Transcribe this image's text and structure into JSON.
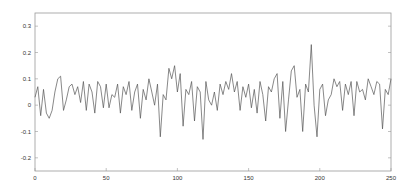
{
  "chart_data": {
    "type": "line",
    "title": "",
    "xlabel": "",
    "ylabel": "",
    "xlim": [
      0,
      250
    ],
    "ylim": [
      -0.25,
      0.35
    ],
    "grid": false,
    "legend": null,
    "xticks": [
      0,
      50,
      100,
      150,
      200,
      250
    ],
    "xtick_labels": [
      "0",
      "50",
      "100",
      "150",
      "200",
      "250"
    ],
    "yticks": [
      -0.2,
      -0.1,
      0,
      0.1,
      0.2,
      0.3
    ],
    "ytick_labels": [
      "-0.2",
      "-0.1",
      "0",
      "0.1",
      "0.2",
      "0.3"
    ],
    "line_color": "#555555",
    "series": [
      {
        "name": "signal",
        "x": [
          0,
          2,
          4,
          6,
          8,
          10,
          12,
          14,
          16,
          18,
          20,
          22,
          24,
          26,
          28,
          30,
          32,
          34,
          36,
          38,
          40,
          42,
          44,
          46,
          48,
          50,
          52,
          54,
          56,
          58,
          60,
          62,
          64,
          66,
          68,
          70,
          72,
          74,
          76,
          78,
          80,
          82,
          84,
          86,
          88,
          90,
          92,
          94,
          96,
          98,
          100,
          102,
          104,
          106,
          108,
          110,
          112,
          114,
          116,
          118,
          120,
          122,
          124,
          126,
          128,
          130,
          132,
          134,
          136,
          138,
          140,
          142,
          144,
          146,
          148,
          150,
          152,
          154,
          156,
          158,
          160,
          162,
          164,
          166,
          168,
          170,
          172,
          174,
          176,
          178,
          180,
          182,
          184,
          186,
          188,
          190,
          192,
          194,
          196,
          198,
          200,
          202,
          204,
          206,
          208,
          210,
          212,
          214,
          216,
          218,
          220,
          222,
          224,
          226,
          228,
          230,
          232,
          234,
          236,
          238,
          240,
          242,
          244,
          246,
          248,
          250
        ],
        "values": [
          0.03,
          0.07,
          -0.04,
          0.06,
          -0.03,
          -0.05,
          -0.02,
          0.05,
          0.1,
          0.11,
          -0.02,
          0.02,
          0.07,
          0.08,
          0.04,
          0.07,
          0.01,
          0.09,
          -0.02,
          0.08,
          0.05,
          -0.03,
          0.09,
          0.07,
          -0.01,
          0.08,
          -0.01,
          0.04,
          0.03,
          0.08,
          -0.03,
          0.07,
          0.04,
          0.09,
          -0.02,
          0.05,
          0.08,
          -0.05,
          0.06,
          0.02,
          0.1,
          0.05,
          0.0,
          0.08,
          -0.12,
          0.04,
          0.02,
          0.14,
          0.1,
          0.15,
          0.05,
          0.12,
          -0.08,
          0.06,
          0.04,
          0.09,
          -0.06,
          0.07,
          0.05,
          -0.13,
          0.09,
          0.02,
          0.0,
          0.05,
          -0.02,
          0.08,
          0.04,
          0.09,
          0.06,
          0.12,
          0.05,
          0.09,
          -0.02,
          0.07,
          0.03,
          0.08,
          -0.01,
          0.06,
          -0.03,
          0.09,
          0.04,
          -0.06,
          0.07,
          0.05,
          0.1,
          0.12,
          -0.05,
          0.09,
          -0.1,
          0.02,
          0.13,
          0.15,
          0.03,
          0.06,
          -0.1,
          0.08,
          0.05,
          0.23,
          0.0,
          -0.12,
          0.06,
          0.08,
          -0.04,
          0.02,
          0.04,
          0.1,
          0.07,
          0.09,
          -0.02,
          0.08,
          0.04,
          0.09,
          -0.04,
          0.09,
          0.05,
          0.06,
          0.02,
          0.1,
          0.07,
          0.04,
          0.09,
          0.08,
          -0.09,
          0.06,
          0.04,
          0.1
        ]
      }
    ]
  }
}
